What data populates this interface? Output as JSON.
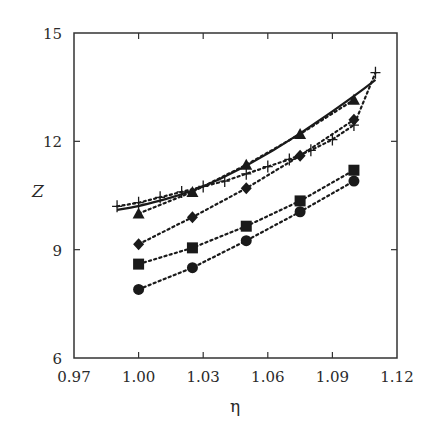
{
  "chart_data": {
    "type": "line",
    "title": "",
    "xlabel": "η",
    "ylabel": "Z",
    "xlim": [
      0.97,
      1.12
    ],
    "ylim": [
      6,
      15
    ],
    "xticks": [
      0.97,
      1.0,
      1.03,
      1.06,
      1.09,
      1.12
    ],
    "xtick_labels": [
      "0.97",
      "1.00",
      "1.03",
      "1.06",
      "1.09",
      "1.12"
    ],
    "yticks": [
      6,
      9,
      12,
      15
    ],
    "ytick_labels": [
      "6",
      "9",
      "12",
      "15"
    ],
    "grid": false,
    "legend": null,
    "series": [
      {
        "name": "plus",
        "marker": "plus",
        "line": "dotted",
        "x": [
          0.99,
          1.0,
          1.01,
          1.02,
          1.03,
          1.04,
          1.05,
          1.06,
          1.07,
          1.08,
          1.09,
          1.1,
          1.11
        ],
        "y": [
          10.2,
          10.3,
          10.45,
          10.6,
          10.75,
          10.9,
          11.1,
          11.3,
          11.5,
          11.75,
          12.05,
          12.45,
          13.9
        ]
      },
      {
        "name": "solid-curve",
        "marker": "none",
        "line": "solid",
        "x": [
          0.99,
          1.0,
          1.025,
          1.05,
          1.075,
          1.1,
          1.11
        ],
        "y": [
          10.1,
          10.2,
          10.6,
          11.3,
          12.2,
          13.25,
          13.7
        ]
      },
      {
        "name": "triangle",
        "marker": "triangle",
        "line": "dotted",
        "x": [
          1.0,
          1.025,
          1.05,
          1.075,
          1.1
        ],
        "y": [
          10.0,
          10.6,
          11.35,
          12.2,
          13.15
        ]
      },
      {
        "name": "diamond",
        "marker": "diamond",
        "line": "dotted",
        "x": [
          1.0,
          1.025,
          1.05,
          1.075,
          1.1
        ],
        "y": [
          9.15,
          9.9,
          10.7,
          11.6,
          12.6
        ]
      },
      {
        "name": "square",
        "marker": "square",
        "line": "dotted",
        "x": [
          1.0,
          1.025,
          1.05,
          1.075,
          1.1
        ],
        "y": [
          8.6,
          9.05,
          9.65,
          10.35,
          11.2
        ]
      },
      {
        "name": "circle",
        "marker": "circle",
        "line": "dotted",
        "x": [
          1.0,
          1.025,
          1.05,
          1.075,
          1.1
        ],
        "y": [
          7.9,
          8.5,
          9.25,
          10.05,
          10.9
        ]
      }
    ]
  },
  "colors": {
    "ink": "#1a1a1a",
    "background": "#ffffff"
  },
  "plot_box": {
    "left": 74,
    "top": 33,
    "right": 397,
    "bottom": 358
  }
}
